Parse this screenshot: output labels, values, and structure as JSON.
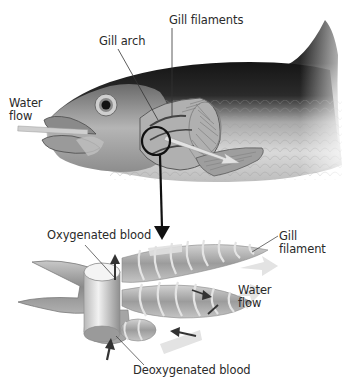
{
  "diagram": {
    "panels": [
      {
        "name": "fish-overview",
        "labels": {
          "water_flow": [
            "Water",
            "flow"
          ],
          "gill_arch": "Gill arch",
          "gill_filaments": "Gill filaments"
        }
      },
      {
        "name": "gill-detail",
        "labels": {
          "oxygenated_blood": "Oxygenated blood",
          "gill_filament": [
            "Gill",
            "filament"
          ],
          "water_flow": [
            "Water",
            "flow"
          ],
          "deoxygenated_blood": "Deoxygenated blood"
        }
      }
    ],
    "colors": {
      "background": "#ffffff",
      "fish_dark": "#1e1e1e",
      "fish_mid": "#8a8a8a",
      "fish_light": "#d6d6d6",
      "water_arrow": "#c8c8c8",
      "blood_arrow": "#3a3a3a",
      "callout_line": "#111111",
      "label_text": "#2a2a2a"
    }
  }
}
